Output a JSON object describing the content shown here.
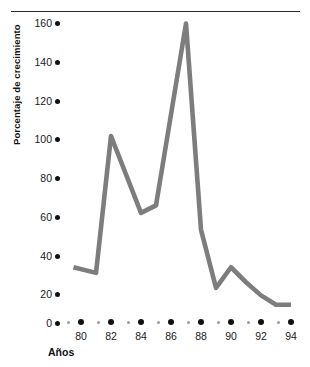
{
  "chart_data": {
    "type": "line",
    "title": "",
    "xlabel": "Años",
    "ylabel": "Porcentaje de crecimiento",
    "x": [
      79.5,
      81,
      82,
      84,
      85,
      87,
      88,
      89,
      90,
      91,
      92,
      93,
      94
    ],
    "values": [
      30,
      27,
      100,
      59,
      63,
      160,
      50,
      19,
      30,
      22,
      15,
      10,
      10
    ],
    "series": [
      {
        "name": "Porcentaje de crecimiento",
        "x": [
          79.5,
          81,
          82,
          84,
          85,
          87,
          88,
          89,
          90,
          91,
          92,
          93,
          94
        ],
        "values": [
          30,
          27,
          100,
          59,
          63,
          160,
          50,
          19,
          30,
          22,
          15,
          10,
          10
        ]
      }
    ],
    "xlim": [
      79,
      94.5
    ],
    "ylim": [
      0,
      168
    ],
    "y_ticks": [
      0,
      20,
      40,
      60,
      80,
      100,
      120,
      140,
      160
    ],
    "x_ticks": [
      80,
      82,
      84,
      86,
      88,
      90,
      92,
      94
    ],
    "x_minor_ticks": [
      79,
      81,
      83,
      85,
      87,
      89,
      91,
      93
    ],
    "grid": false,
    "legend": "none",
    "line_color": "#7d7d7d",
    "tick_color": "#111111",
    "minor_tick_color": "#9b9b9b",
    "axis_rule_color": "#2b2b2b"
  },
  "axes": {
    "y_title": "Porcentaje de crecimiento",
    "x_title": "Años",
    "y_tick_labels": [
      "160",
      "140",
      "120",
      "100",
      "80",
      "60",
      "40",
      "20",
      "0"
    ],
    "x_tick_labels": [
      "80",
      "82",
      "84",
      "86",
      "88",
      "90",
      "92",
      "94"
    ]
  }
}
